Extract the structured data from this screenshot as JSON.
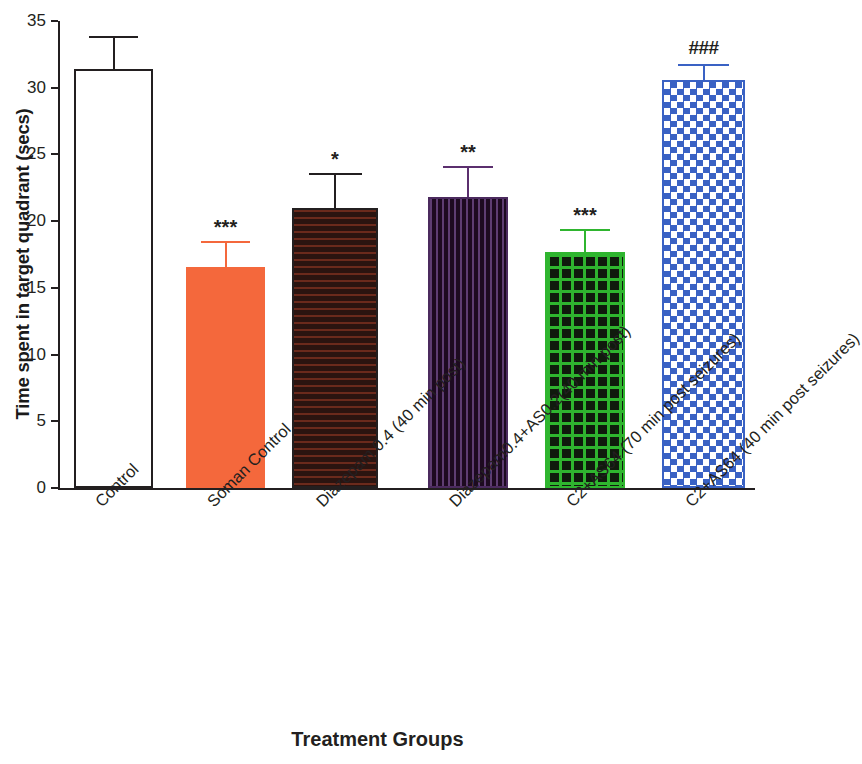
{
  "chart_data": {
    "type": "bar",
    "title": "",
    "xlabel": "Treatment Groups",
    "ylabel": "Time spent in target quadrant (secs)",
    "ylim": [
      0,
      35
    ],
    "yticks": [
      0,
      5,
      10,
      15,
      20,
      25,
      30,
      35
    ],
    "ytick_labels": [
      "0",
      "5",
      "10",
      "15",
      "20",
      "25",
      "30",
      "35"
    ],
    "grid": false,
    "legend": "none",
    "categories": [
      "Control",
      "Soman Control",
      "Diazepam 0.4 (40 min post)",
      "Diazepam0.4+AS0.2(40 min post)",
      "C2+AS64 (70 min post seizures)",
      "C2+AS64 (40 min post seizures)"
    ],
    "values": [
      31.4,
      16.6,
      21.0,
      21.8,
      17.7,
      30.6
    ],
    "errors": [
      2.5,
      1.9,
      2.6,
      2.3,
      1.7,
      1.2
    ],
    "annotations": [
      "",
      "***",
      "*",
      "**",
      "***",
      "###"
    ],
    "bar_styles": [
      {
        "name": "open",
        "fill": "#ffffff",
        "edge": "#231f20",
        "pattern": "none",
        "error_color": "#231f20"
      },
      {
        "name": "solid-orange",
        "fill": "#f4683c",
        "edge": "#f4683c",
        "pattern": "none",
        "error_color": "#f4683c"
      },
      {
        "name": "horizontal-stripes-dark",
        "fill": "#2b1410",
        "edge": "#231f20",
        "pattern": "horizontal",
        "stripe": "#6b2a1c",
        "error_color": "#231f20"
      },
      {
        "name": "vertical-stripes-purple",
        "fill": "#1d0a20",
        "edge": "#4b2a5e",
        "pattern": "vertical",
        "stripe": "#5e3d72",
        "error_color": "#5b2f6e"
      },
      {
        "name": "grid-green",
        "fill": "#101b0d",
        "edge": "#2fb52f",
        "pattern": "grid",
        "stripe": "#2fb52f",
        "error_color": "#2fb52f"
      },
      {
        "name": "checker-blue",
        "fill": "#ffffff",
        "edge": "#3a62c4",
        "pattern": "checker",
        "stripe": "#3a62c4",
        "error_color": "#3a62c4"
      }
    ]
  },
  "axis": {
    "ylabel": "Time spent in target quadrant (secs)",
    "xlabel": "Treatment Groups"
  }
}
